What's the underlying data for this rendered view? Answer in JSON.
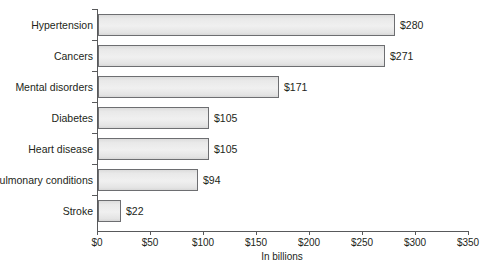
{
  "chart_data": {
    "type": "bar",
    "orientation": "horizontal",
    "title": "",
    "subtitle": "",
    "xlabel": "In billions",
    "ylabel": "",
    "categories": [
      "Hypertension",
      "Cancers",
      "Mental disorders",
      "Diabetes",
      "Heart disease",
      "Pulmonary conditions",
      "Stroke"
    ],
    "values": [
      280,
      271,
      171,
      105,
      105,
      94,
      22
    ],
    "data_labels": [
      "$280",
      "$271",
      "$171",
      "$105",
      "$105",
      "$94",
      "$22"
    ],
    "xlim": [
      0,
      350
    ],
    "xticks": [
      0,
      50,
      100,
      150,
      200,
      250,
      300,
      350
    ],
    "xtick_labels": [
      "$0",
      "$50",
      "$100",
      "$150",
      "$200",
      "$250",
      "$300",
      "$350"
    ],
    "grid": false,
    "legend": null,
    "value_prefix": "$",
    "units": "billions of US dollars",
    "colors": {
      "bar_fill": "#ededed",
      "bar_border": "#6d6e71",
      "axis": "#58595b",
      "text": "#231f20",
      "background": "#ffffff"
    }
  },
  "axis": {
    "x_title": "In billions"
  }
}
